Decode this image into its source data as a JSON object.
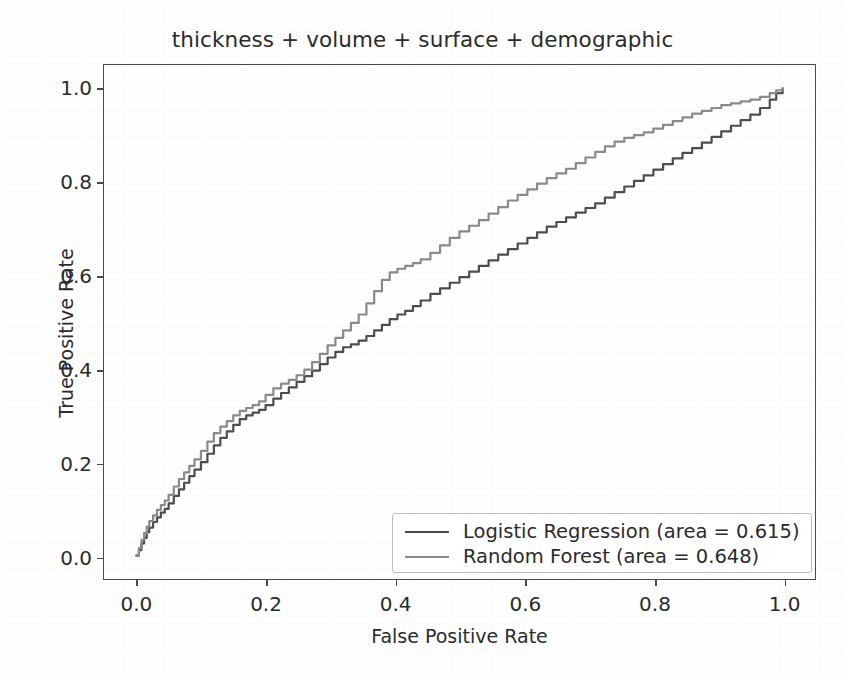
{
  "chart_data": {
    "type": "line",
    "title": "thickness + volume + surface + demographic",
    "xlabel": "False Positive Rate",
    "ylabel": "True Positive Rate",
    "xlim": [
      -0.05,
      1.05
    ],
    "ylim": [
      -0.05,
      1.05
    ],
    "xticks": [
      "0.0",
      "0.2",
      "0.4",
      "0.6",
      "0.8",
      "1.0"
    ],
    "xtick_values": [
      0.0,
      0.2,
      0.4,
      0.6,
      0.8,
      1.0
    ],
    "yticks": [
      "0.0",
      "0.2",
      "0.4",
      "0.6",
      "0.8",
      "1.0"
    ],
    "ytick_values": [
      0.0,
      0.2,
      0.4,
      0.6,
      0.8,
      1.0
    ],
    "grid": false,
    "legend_position": "lower right",
    "series": [
      {
        "name": "Logistic Regression (area = 0.615)",
        "model": "Logistic Regression",
        "auc": 0.615,
        "color": "#4d4d4d",
        "x": [
          0.0,
          0.004,
          0.008,
          0.012,
          0.016,
          0.02,
          0.026,
          0.032,
          0.038,
          0.044,
          0.05,
          0.058,
          0.066,
          0.074,
          0.082,
          0.09,
          0.1,
          0.11,
          0.12,
          0.13,
          0.14,
          0.15,
          0.16,
          0.17,
          0.18,
          0.19,
          0.2,
          0.212,
          0.224,
          0.236,
          0.248,
          0.26,
          0.272,
          0.284,
          0.296,
          0.308,
          0.32,
          0.332,
          0.344,
          0.356,
          0.368,
          0.38,
          0.392,
          0.404,
          0.416,
          0.428,
          0.44,
          0.455,
          0.47,
          0.485,
          0.5,
          0.515,
          0.53,
          0.545,
          0.56,
          0.575,
          0.59,
          0.605,
          0.62,
          0.635,
          0.65,
          0.665,
          0.68,
          0.695,
          0.71,
          0.725,
          0.74,
          0.755,
          0.77,
          0.785,
          0.8,
          0.815,
          0.83,
          0.845,
          0.86,
          0.875,
          0.89,
          0.905,
          0.92,
          0.935,
          0.95,
          0.965,
          0.98,
          0.99,
          1.0
        ],
        "y": [
          0.0,
          0.012,
          0.026,
          0.038,
          0.05,
          0.06,
          0.072,
          0.082,
          0.092,
          0.1,
          0.112,
          0.128,
          0.142,
          0.156,
          0.17,
          0.184,
          0.2,
          0.218,
          0.236,
          0.252,
          0.266,
          0.28,
          0.292,
          0.3,
          0.306,
          0.312,
          0.322,
          0.336,
          0.348,
          0.36,
          0.372,
          0.384,
          0.396,
          0.41,
          0.424,
          0.436,
          0.446,
          0.452,
          0.46,
          0.47,
          0.482,
          0.494,
          0.506,
          0.516,
          0.524,
          0.534,
          0.546,
          0.56,
          0.572,
          0.584,
          0.596,
          0.608,
          0.62,
          0.632,
          0.644,
          0.656,
          0.668,
          0.68,
          0.692,
          0.704,
          0.714,
          0.724,
          0.734,
          0.744,
          0.754,
          0.766,
          0.778,
          0.79,
          0.802,
          0.814,
          0.826,
          0.838,
          0.85,
          0.862,
          0.872,
          0.884,
          0.896,
          0.908,
          0.92,
          0.932,
          0.944,
          0.958,
          0.976,
          0.99,
          1.0
        ]
      },
      {
        "name": "Random Forest (area = 0.648)",
        "model": "Random Forest",
        "auc": 0.648,
        "color": "#8a8a8a",
        "x": [
          0.0,
          0.004,
          0.008,
          0.012,
          0.016,
          0.02,
          0.026,
          0.032,
          0.038,
          0.044,
          0.05,
          0.058,
          0.066,
          0.074,
          0.082,
          0.09,
          0.1,
          0.11,
          0.12,
          0.13,
          0.14,
          0.15,
          0.16,
          0.17,
          0.18,
          0.19,
          0.2,
          0.212,
          0.224,
          0.236,
          0.248,
          0.26,
          0.272,
          0.284,
          0.296,
          0.308,
          0.32,
          0.332,
          0.344,
          0.356,
          0.368,
          0.38,
          0.392,
          0.404,
          0.416,
          0.428,
          0.44,
          0.455,
          0.47,
          0.485,
          0.5,
          0.515,
          0.53,
          0.545,
          0.56,
          0.575,
          0.59,
          0.605,
          0.62,
          0.635,
          0.65,
          0.665,
          0.68,
          0.695,
          0.71,
          0.725,
          0.74,
          0.755,
          0.77,
          0.785,
          0.8,
          0.815,
          0.83,
          0.845,
          0.86,
          0.875,
          0.89,
          0.905,
          0.92,
          0.935,
          0.95,
          0.965,
          0.98,
          0.99,
          1.0
        ],
        "y": [
          0.0,
          0.016,
          0.034,
          0.048,
          0.062,
          0.074,
          0.086,
          0.098,
          0.108,
          0.118,
          0.13,
          0.148,
          0.164,
          0.178,
          0.192,
          0.206,
          0.224,
          0.244,
          0.262,
          0.276,
          0.288,
          0.3,
          0.31,
          0.316,
          0.322,
          0.33,
          0.344,
          0.358,
          0.368,
          0.376,
          0.386,
          0.398,
          0.414,
          0.432,
          0.45,
          0.466,
          0.482,
          0.498,
          0.516,
          0.54,
          0.566,
          0.59,
          0.606,
          0.614,
          0.62,
          0.626,
          0.634,
          0.648,
          0.664,
          0.68,
          0.694,
          0.706,
          0.718,
          0.732,
          0.746,
          0.76,
          0.772,
          0.784,
          0.796,
          0.808,
          0.818,
          0.828,
          0.84,
          0.852,
          0.864,
          0.876,
          0.886,
          0.894,
          0.9,
          0.906,
          0.914,
          0.922,
          0.93,
          0.938,
          0.946,
          0.952,
          0.958,
          0.964,
          0.968,
          0.972,
          0.976,
          0.982,
          0.99,
          0.996,
          1.0
        ]
      }
    ]
  }
}
